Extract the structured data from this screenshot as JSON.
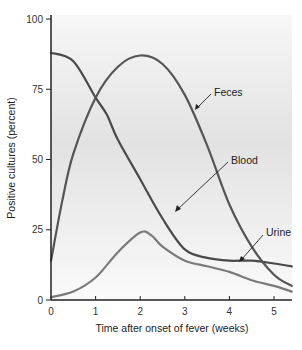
{
  "chart_data": {
    "type": "line",
    "title": "",
    "xlabel": "Time after onset of fever (weeks)",
    "ylabel": "Positive cultures (percent)",
    "xlim": [
      0,
      5.4
    ],
    "ylim": [
      0,
      100
    ],
    "xticks": [
      0,
      1,
      2,
      3,
      4,
      5
    ],
    "yticks": [
      0,
      25,
      50,
      75,
      100
    ],
    "grid": false,
    "legend": "inline annotations with arrows",
    "series": [
      {
        "name": "Blood",
        "color": "#4a4a4a",
        "x": [
          0,
          0.5,
          1,
          1.25,
          1.5,
          2,
          2.5,
          3,
          3.5,
          4,
          4.5,
          5,
          5.4
        ],
        "y": [
          88,
          85,
          72,
          66,
          57,
          43,
          29,
          18,
          15,
          14,
          14,
          13,
          12
        ]
      },
      {
        "name": "Feces",
        "color": "#555555",
        "x": [
          0,
          0.25,
          0.5,
          1,
          1.5,
          2,
          2.5,
          3,
          3.5,
          4,
          4.5,
          5,
          5.4
        ],
        "y": [
          14,
          35,
          52,
          72,
          83,
          87,
          84,
          73,
          55,
          34,
          19,
          9,
          5
        ]
      },
      {
        "name": "Urine",
        "color": "#7a7a7a",
        "x": [
          0,
          0.5,
          1,
          1.5,
          2,
          2.25,
          2.5,
          3,
          3.5,
          4,
          4.5,
          5,
          5.4
        ],
        "y": [
          1,
          3,
          8,
          17,
          24,
          23,
          19,
          14,
          12,
          10,
          7,
          5,
          3
        ]
      }
    ],
    "annotations": [
      {
        "text": "Feces",
        "points_to_series": "Feces"
      },
      {
        "text": "Blood",
        "points_to_series": "Blood"
      },
      {
        "text": "Urine",
        "points_to_series": "Urine"
      }
    ]
  },
  "labels": {
    "xlabel": "Time after onset of fever (weeks)",
    "ylabel": "Positive cultures (percent)",
    "xticks": [
      "0",
      "1",
      "2",
      "3",
      "4",
      "5"
    ],
    "yticks": [
      "0",
      "25",
      "50",
      "75",
      "100"
    ],
    "feces": "Feces",
    "blood": "Blood",
    "urine": "Urine"
  }
}
